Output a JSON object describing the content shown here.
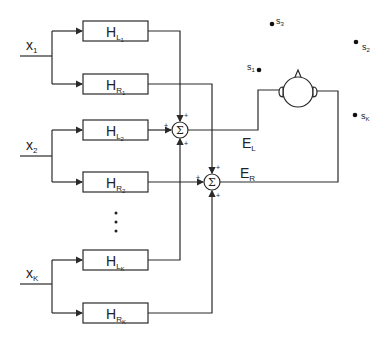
{
  "diagram": {
    "inputs": [
      {
        "id": "x1",
        "label": "x",
        "sub": "1",
        "y": 56
      },
      {
        "id": "x2",
        "label": "x",
        "sub": "2",
        "y": 156
      },
      {
        "id": "xK",
        "label": "x",
        "sub": "K",
        "y": 284
      }
    ],
    "filters": [
      {
        "id": "HL1",
        "label": "H",
        "sub": "L",
        "subsub": "1",
        "y": 21
      },
      {
        "id": "HR1",
        "label": "H",
        "sub": "R",
        "subsub": "1",
        "y": 74
      },
      {
        "id": "HL2",
        "label": "H",
        "sub": "L",
        "subsub": "2",
        "y": 120
      },
      {
        "id": "HR2",
        "label": "H",
        "sub": "R",
        "subsub": "2",
        "y": 172
      },
      {
        "id": "HLK",
        "label": "H",
        "sub": "L",
        "subsub": "K",
        "y": 250
      },
      {
        "id": "HRK",
        "label": "H",
        "sub": "R",
        "subsub": "K",
        "y": 303
      }
    ],
    "ellipsis": "⋮",
    "summers": [
      {
        "id": "sumL",
        "symbol": "Σ",
        "cx": 180,
        "cy": 130,
        "signs": [
          "+",
          "+",
          "+"
        ]
      },
      {
        "id": "sumR",
        "symbol": "Σ",
        "cx": 212,
        "cy": 182,
        "signs": [
          "+",
          "+",
          "+"
        ]
      }
    ],
    "outputs": [
      {
        "id": "EL",
        "label": "E",
        "sub": "L"
      },
      {
        "id": "ER",
        "label": "E",
        "sub": "R"
      }
    ],
    "sources": [
      {
        "id": "s1",
        "label": "s",
        "sub": "1",
        "x": 259,
        "y": 70
      },
      {
        "id": "s2",
        "label": "s",
        "sub": "2",
        "x": 356,
        "y": 42
      },
      {
        "id": "s3",
        "label": "s",
        "sub": "3",
        "x": 272,
        "y": 24
      },
      {
        "id": "sK",
        "label": "s",
        "sub": "K",
        "x": 355,
        "y": 115
      }
    ],
    "listener": {
      "type": "head-with-ears",
      "cx": 298,
      "cy": 92,
      "r": 15
    }
  }
}
